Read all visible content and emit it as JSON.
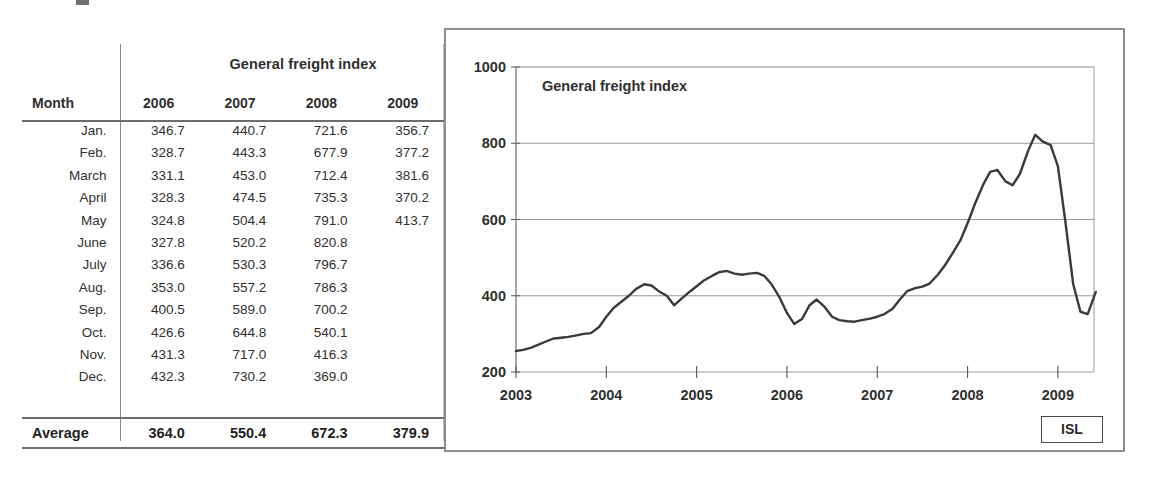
{
  "table": {
    "title": "General freight index",
    "month_header": "Month",
    "year_headers": [
      "2006",
      "2007",
      "2008",
      "2009"
    ],
    "rows": [
      {
        "month": "Jan.",
        "values": [
          "346.7",
          "440.7",
          "721.6",
          "356.7"
        ]
      },
      {
        "month": "Feb.",
        "values": [
          "328.7",
          "443.3",
          "677.9",
          "377.2"
        ]
      },
      {
        "month": "March",
        "values": [
          "331.1",
          "453.0",
          "712.4",
          "381.6"
        ]
      },
      {
        "month": "April",
        "values": [
          "328.3",
          "474.5",
          "735.3",
          "370.2"
        ]
      },
      {
        "month": "May",
        "values": [
          "324.8",
          "504.4",
          "791.0",
          "413.7"
        ]
      },
      {
        "month": "June",
        "values": [
          "327.8",
          "520.2",
          "820.8",
          ""
        ]
      },
      {
        "month": "July",
        "values": [
          "336.6",
          "530.3",
          "796.7",
          ""
        ]
      },
      {
        "month": "Aug.",
        "values": [
          "353.0",
          "557.2",
          "786.3",
          ""
        ]
      },
      {
        "month": "Sep.",
        "values": [
          "400.5",
          "589.0",
          "700.2",
          ""
        ]
      },
      {
        "month": "Oct.",
        "values": [
          "426.6",
          "644.8",
          "540.1",
          ""
        ]
      },
      {
        "month": "Nov.",
        "values": [
          "431.3",
          "717.0",
          "416.3",
          ""
        ]
      },
      {
        "month": "Dec.",
        "values": [
          "432.3",
          "730.2",
          "369.0",
          ""
        ]
      }
    ],
    "average_label": "Average",
    "average_values": [
      "364.0",
      "550.4",
      "672.3",
      "379.9"
    ]
  },
  "chart": {
    "inner_title": "General freight index",
    "source_badge": "ISL"
  },
  "chart_data": {
    "type": "line",
    "title": "General freight index",
    "xlabel": "",
    "ylabel": "",
    "xlim": [
      2003,
      2009.4
    ],
    "ylim": [
      200,
      1000
    ],
    "yticks": [
      200,
      400,
      600,
      800,
      1000
    ],
    "xticks": [
      2003,
      2004,
      2005,
      2006,
      2007,
      2008,
      2009
    ],
    "xtick_labels": [
      "2003",
      "2004",
      "2005",
      "2006",
      "2007",
      "2008",
      "2009"
    ],
    "grid": "horizontal",
    "legend": "none",
    "line_color": "#3a3a3a",
    "series": [
      {
        "name": "General freight index",
        "x": [
          2003.0,
          2003.08,
          2003.17,
          2003.25,
          2003.33,
          2003.42,
          2003.5,
          2003.58,
          2003.67,
          2003.75,
          2003.83,
          2003.92,
          2004.0,
          2004.08,
          2004.17,
          2004.25,
          2004.33,
          2004.42,
          2004.5,
          2004.58,
          2004.67,
          2004.75,
          2004.83,
          2004.92,
          2005.0,
          2005.08,
          2005.17,
          2005.25,
          2005.33,
          2005.42,
          2005.5,
          2005.58,
          2005.67,
          2005.75,
          2005.83,
          2005.92,
          2006.0,
          2006.08,
          2006.17,
          2006.25,
          2006.33,
          2006.42,
          2006.5,
          2006.58,
          2006.67,
          2006.75,
          2006.83,
          2006.92,
          2007.0,
          2007.08,
          2007.17,
          2007.25,
          2007.33,
          2007.42,
          2007.5,
          2007.58,
          2007.67,
          2007.75,
          2007.83,
          2007.92,
          2008.0,
          2008.08,
          2008.17,
          2008.25,
          2008.33,
          2008.42,
          2008.5,
          2008.58,
          2008.67,
          2008.75,
          2008.83,
          2008.92,
          2009.0,
          2009.08,
          2009.17,
          2009.25,
          2009.33,
          2009.42
        ],
        "values": [
          255,
          258,
          264,
          272,
          280,
          288,
          290,
          292,
          296,
          300,
          302,
          318,
          345,
          368,
          385,
          400,
          418,
          430,
          427,
          412,
          400,
          375,
          392,
          410,
          425,
          440,
          452,
          462,
          465,
          458,
          455,
          458,
          460,
          452,
          430,
          395,
          355,
          326,
          340,
          375,
          390,
          370,
          345,
          336,
          333,
          332,
          336,
          340,
          345,
          352,
          366,
          390,
          412,
          420,
          424,
          432,
          455,
          480,
          510,
          545,
          590,
          640,
          690,
          725,
          730,
          700,
          690,
          720,
          780,
          822,
          805,
          795,
          740,
          600,
          430,
          358,
          352,
          410
        ]
      }
    ],
    "annotations": [
      {
        "text": "General freight index",
        "x": 2003.25,
        "y": 930
      },
      {
        "text": "ISL",
        "x": 2009.1,
        "y": 150
      }
    ]
  }
}
